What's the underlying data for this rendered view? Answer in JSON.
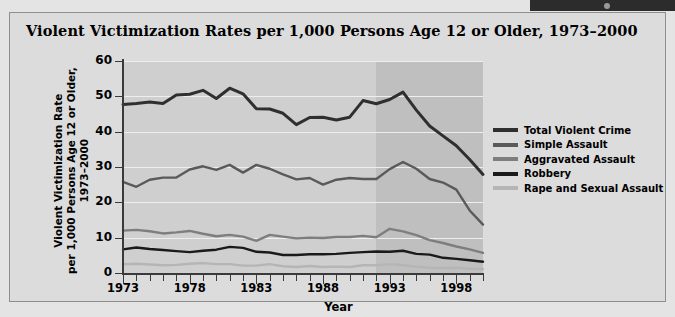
{
  "figure": {
    "title": "Violent Victimization Rates per 1,000 Persons Age 12 or Older, 1973–2000"
  },
  "topbar": {
    "icon": "window-dot"
  },
  "chart_data": {
    "type": "line",
    "title": "Violent Victimization Rates per 1,000 Persons Age 12 or Older, 1973–2000",
    "xlabel": "Year",
    "ylabel": "Violent Victimization Rate\nper 1,000 Persons Age 12 or Older,\n1973–2000",
    "xlim": [
      1973,
      2000
    ],
    "ylim": [
      0,
      60
    ],
    "yticks": [
      0,
      10,
      20,
      30,
      40,
      50,
      60
    ],
    "xticks_labeled": [
      1973,
      1978,
      1983,
      1988,
      1993,
      1998
    ],
    "xticks_all": [
      1973,
      1974,
      1975,
      1976,
      1977,
      1978,
      1979,
      1980,
      1981,
      1982,
      1983,
      1984,
      1985,
      1986,
      1987,
      1988,
      1989,
      1990,
      1991,
      1992,
      1993,
      1994,
      1995,
      1996,
      1997,
      1998,
      1999,
      2000
    ],
    "grid": true,
    "grid_color": "#eeeeee",
    "plot_bg": "#cfcfcf",
    "shaded_region": {
      "from": 1992,
      "to": 2000,
      "color": "#bfbfbf",
      "note": "redesigned survey period shading"
    },
    "legend_position": "right",
    "x": [
      1973,
      1974,
      1975,
      1976,
      1977,
      1978,
      1979,
      1980,
      1981,
      1982,
      1983,
      1984,
      1985,
      1986,
      1987,
      1988,
      1989,
      1990,
      1991,
      1992,
      1993,
      1994,
      1995,
      1996,
      1997,
      1998,
      1999,
      2000
    ],
    "series": [
      {
        "name": "Total Violent Crime",
        "color": "#2f2f2f",
        "width": 3.0,
        "values": [
          47.7,
          48.0,
          48.4,
          48.0,
          50.4,
          50.6,
          51.7,
          49.4,
          52.3,
          50.7,
          46.5,
          46.4,
          45.2,
          42.0,
          44.0,
          44.1,
          43.3,
          44.1,
          48.8,
          47.9,
          49.1,
          51.2,
          46.1,
          41.6,
          38.8,
          36.0,
          32.1,
          27.9
        ]
      },
      {
        "name": "Simple Assault",
        "color": "#5a5a5a",
        "width": 2.4,
        "values": [
          25.8,
          24.4,
          26.4,
          27.0,
          27.0,
          29.3,
          30.2,
          29.2,
          30.6,
          28.4,
          30.6,
          29.5,
          27.9,
          26.5,
          26.9,
          25.0,
          26.4,
          26.9,
          26.6,
          26.6,
          29.4,
          31.4,
          29.5,
          26.6,
          25.6,
          23.6,
          17.7,
          13.7
        ]
      },
      {
        "name": "Aggravated Assault",
        "color": "#7e7e7e",
        "width": 2.4,
        "values": [
          12.0,
          12.2,
          11.8,
          11.2,
          11.5,
          11.9,
          11.1,
          10.4,
          10.8,
          10.3,
          9.1,
          10.8,
          10.3,
          9.8,
          10.0,
          9.9,
          10.2,
          10.2,
          10.5,
          10.1,
          12.5,
          11.8,
          10.7,
          9.3,
          8.5,
          7.5,
          6.7,
          5.7
        ]
      },
      {
        "name": "Robbery",
        "color": "#1a1a1a",
        "width": 2.4,
        "values": [
          6.7,
          7.2,
          6.8,
          6.5,
          6.2,
          5.9,
          6.3,
          6.6,
          7.4,
          7.1,
          6.0,
          5.8,
          5.1,
          5.1,
          5.3,
          5.3,
          5.4,
          5.7,
          5.9,
          6.1,
          6.0,
          6.3,
          5.4,
          5.2,
          4.3,
          4.0,
          3.6,
          3.2
        ]
      },
      {
        "name": "Rape and Sexual Assault",
        "color": "#b5b5b5",
        "width": 2.4,
        "values": [
          2.5,
          2.6,
          2.4,
          2.2,
          2.3,
          2.6,
          2.8,
          2.5,
          2.5,
          2.1,
          2.1,
          2.5,
          1.9,
          1.7,
          2.0,
          1.7,
          1.8,
          1.7,
          2.2,
          2.2,
          2.5,
          2.2,
          1.8,
          1.5,
          1.4,
          1.5,
          1.2,
          1.1
        ]
      }
    ]
  },
  "legend": {
    "items": [
      {
        "label": "Total Violent Crime",
        "color": "#2f2f2f"
      },
      {
        "label": "Simple Assault",
        "color": "#5a5a5a"
      },
      {
        "label": "Aggravated Assault",
        "color": "#7e7e7e"
      },
      {
        "label": "Robbery",
        "color": "#1a1a1a"
      },
      {
        "label": "Rape and Sexual Assault",
        "color": "#b5b5b5"
      }
    ]
  },
  "axes": {
    "x_title": "Year",
    "y_title_lines": [
      "Violent Victimization Rate",
      "per 1,000 Persons Age 12 or Older,",
      "1973–2000"
    ],
    "y_tick_labels": [
      "60",
      "50",
      "40",
      "30",
      "20",
      "10",
      "0"
    ],
    "x_tick_labels": [
      "1973",
      "1978",
      "1983",
      "1988",
      "1993",
      "1998"
    ]
  }
}
